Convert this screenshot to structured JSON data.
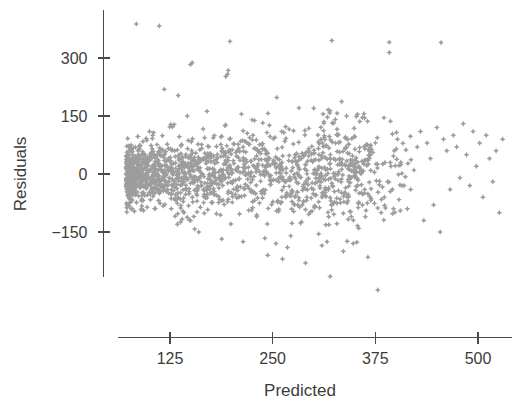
{
  "chart_data": {
    "type": "scatter",
    "title": "",
    "xlabel": "Predicted",
    "ylabel": "Residuals",
    "xlim": [
      62,
      540
    ],
    "ylim": [
      -330,
      410
    ],
    "xticks": [
      125,
      250,
      375,
      500
    ],
    "xticklabels": [
      "125",
      "250",
      "375",
      "500"
    ],
    "yticks": [
      300,
      150,
      0,
      -150
    ],
    "yticklabels": [
      "300",
      "150",
      "0",
      "-150"
    ],
    "grid": false,
    "legend": null,
    "marker": "4-pointed-star",
    "marker_color": "#9d9d9d",
    "n_points": 1400,
    "points": [
      [
        84,
        388
      ],
      [
        112,
        383
      ],
      [
        198,
        343
      ],
      [
        322,
        345
      ],
      [
        392,
        341
      ],
      [
        455,
        340
      ],
      [
        392,
        314
      ],
      [
        152,
        288
      ],
      [
        150,
        283
      ],
      [
        196,
        268
      ],
      [
        195,
        258
      ],
      [
        193,
        252
      ],
      [
        118,
        219
      ],
      [
        135,
        203
      ],
      [
        255,
        198
      ],
      [
        282,
        171
      ],
      [
        146,
        150
      ],
      [
        170,
        162
      ],
      [
        212,
        155
      ],
      [
        225,
        140
      ],
      [
        300,
        170
      ],
      [
        340,
        150
      ],
      [
        356,
        136
      ],
      [
        294,
        118
      ],
      [
        312,
        112
      ],
      [
        330,
        102
      ],
      [
        270,
        116
      ],
      [
        246,
        126
      ],
      [
        238,
        132
      ],
      [
        130,
        128
      ],
      [
        100,
        110
      ],
      [
        104,
        100
      ],
      [
        96,
        92
      ],
      [
        92,
        84
      ],
      [
        88,
        72
      ],
      [
        86,
        60
      ],
      [
        90,
        48
      ],
      [
        94,
        36
      ],
      [
        98,
        24
      ],
      [
        102,
        12
      ],
      [
        106,
        4
      ],
      [
        110,
        -6
      ],
      [
        114,
        -18
      ],
      [
        118,
        -28
      ],
      [
        122,
        -40
      ],
      [
        126,
        -52
      ],
      [
        130,
        -64
      ],
      [
        134,
        -76
      ],
      [
        138,
        -88
      ],
      [
        142,
        -100
      ],
      [
        146,
        -112
      ],
      [
        150,
        -120
      ],
      [
        154,
        -110
      ],
      [
        158,
        -98
      ],
      [
        162,
        -86
      ],
      [
        166,
        -74
      ],
      [
        170,
        -62
      ],
      [
        174,
        -50
      ],
      [
        178,
        -38
      ],
      [
        182,
        -26
      ],
      [
        186,
        -14
      ],
      [
        190,
        -2
      ],
      [
        194,
        10
      ],
      [
        198,
        22
      ],
      [
        202,
        34
      ],
      [
        206,
        46
      ],
      [
        210,
        58
      ],
      [
        214,
        70
      ],
      [
        218,
        82
      ],
      [
        222,
        94
      ],
      [
        226,
        100
      ],
      [
        230,
        88
      ],
      [
        234,
        76
      ],
      [
        238,
        64
      ],
      [
        242,
        52
      ],
      [
        246,
        40
      ],
      [
        250,
        28
      ],
      [
        254,
        16
      ],
      [
        258,
        4
      ],
      [
        262,
        -8
      ],
      [
        266,
        -20
      ],
      [
        270,
        -32
      ],
      [
        274,
        -44
      ],
      [
        278,
        -56
      ],
      [
        282,
        -68
      ],
      [
        286,
        -80
      ],
      [
        290,
        -92
      ],
      [
        294,
        -104
      ],
      [
        298,
        -96
      ],
      [
        302,
        -84
      ],
      [
        306,
        -72
      ],
      [
        310,
        -60
      ],
      [
        314,
        -48
      ],
      [
        318,
        -36
      ],
      [
        322,
        -24
      ],
      [
        326,
        -12
      ],
      [
        330,
        0
      ],
      [
        334,
        12
      ],
      [
        338,
        24
      ],
      [
        342,
        20
      ],
      [
        346,
        8
      ],
      [
        350,
        -4
      ],
      [
        354,
        -16
      ],
      [
        358,
        -28
      ],
      [
        362,
        -40
      ],
      [
        366,
        -52
      ],
      [
        370,
        -64
      ],
      [
        374,
        -76
      ],
      [
        378,
        -88
      ],
      [
        382,
        -100
      ],
      [
        386,
        -60
      ],
      [
        390,
        -20
      ],
      [
        394,
        20
      ],
      [
        398,
        60
      ],
      [
        402,
        90
      ],
      [
        406,
        30
      ],
      [
        410,
        -30
      ],
      [
        414,
        -90
      ],
      [
        418,
        -40
      ],
      [
        422,
        10
      ],
      [
        426,
        70
      ],
      [
        430,
        110
      ],
      [
        434,
        -120
      ],
      [
        438,
        80
      ],
      [
        442,
        40
      ],
      [
        446,
        -80
      ],
      [
        450,
        120
      ],
      [
        454,
        -150
      ],
      [
        458,
        90
      ],
      [
        462,
        60
      ],
      [
        466,
        -40
      ],
      [
        470,
        100
      ],
      [
        474,
        70
      ],
      [
        478,
        -10
      ],
      [
        482,
        130
      ],
      [
        486,
        50
      ],
      [
        490,
        -30
      ],
      [
        494,
        110
      ],
      [
        498,
        20
      ],
      [
        502,
        80
      ],
      [
        506,
        -60
      ],
      [
        510,
        100
      ],
      [
        514,
        40
      ],
      [
        518,
        -20
      ],
      [
        522,
        60
      ],
      [
        526,
        -100
      ],
      [
        530,
        90
      ],
      [
        254,
        -180
      ],
      [
        268,
        -190
      ],
      [
        310,
        -185
      ],
      [
        336,
        -200
      ],
      [
        366,
        -215
      ],
      [
        320,
        -265
      ],
      [
        378,
        -300
      ],
      [
        348,
        -180
      ],
      [
        306,
        -155
      ],
      [
        272,
        -160
      ],
      [
        188,
        -168
      ],
      [
        214,
        -175
      ],
      [
        160,
        -150
      ],
      [
        134,
        -130
      ],
      [
        244,
        -210
      ],
      [
        262,
        -220
      ],
      [
        290,
        -230
      ]
    ]
  },
  "axis": {
    "y_axis_name": "y-axis",
    "x_axis_name": "x-axis"
  }
}
